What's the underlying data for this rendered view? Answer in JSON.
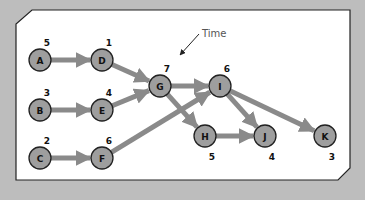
{
  "annotation": {
    "label": "Time"
  },
  "colors": {
    "background": "#bdbdbd",
    "panel": "#ffffff",
    "panel_border": "#222222",
    "node_fill": "#9e9e9e",
    "node_stroke": "#222222",
    "edge": "#8a8a8a",
    "text": "#111111",
    "annotation_text": "#555555"
  },
  "nodes": [
    {
      "id": "A",
      "time": "5",
      "x": 40,
      "y": 60,
      "time_pos": "above"
    },
    {
      "id": "D",
      "time": "1",
      "x": 102,
      "y": 60,
      "time_pos": "above"
    },
    {
      "id": "B",
      "time": "3",
      "x": 40,
      "y": 110,
      "time_pos": "above"
    },
    {
      "id": "E",
      "time": "4",
      "x": 102,
      "y": 110,
      "time_pos": "above"
    },
    {
      "id": "C",
      "time": "2",
      "x": 40,
      "y": 158,
      "time_pos": "above"
    },
    {
      "id": "F",
      "time": "6",
      "x": 102,
      "y": 158,
      "time_pos": "above"
    },
    {
      "id": "G",
      "time": "7",
      "x": 160,
      "y": 86,
      "time_pos": "above"
    },
    {
      "id": "I",
      "time": "6",
      "x": 220,
      "y": 86,
      "time_pos": "above"
    },
    {
      "id": "H",
      "time": "5",
      "x": 205,
      "y": 136,
      "time_pos": "below"
    },
    {
      "id": "J",
      "time": "4",
      "x": 265,
      "y": 136,
      "time_pos": "below"
    },
    {
      "id": "K",
      "time": "3",
      "x": 325,
      "y": 136,
      "time_pos": "below"
    }
  ],
  "edges": [
    {
      "from": "A",
      "to": "D"
    },
    {
      "from": "B",
      "to": "E"
    },
    {
      "from": "C",
      "to": "F"
    },
    {
      "from": "D",
      "to": "G"
    },
    {
      "from": "E",
      "to": "G"
    },
    {
      "from": "F",
      "to": "I"
    },
    {
      "from": "G",
      "to": "I"
    },
    {
      "from": "G",
      "to": "H"
    },
    {
      "from": "H",
      "to": "J"
    },
    {
      "from": "I",
      "to": "J"
    },
    {
      "from": "I",
      "to": "K"
    }
  ]
}
